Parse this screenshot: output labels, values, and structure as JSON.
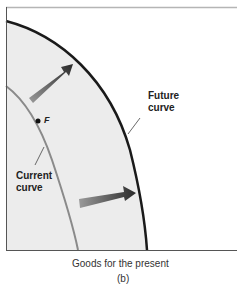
{
  "figure": {
    "panel_label": "(b)",
    "x_axis_label": "Goods for the present",
    "curves": [
      {
        "name": "Future curve",
        "line1": "Future",
        "line2": "curve",
        "color": "#1a1a1a"
      },
      {
        "name": "Current curve",
        "line1": "Current",
        "line2": "curve",
        "color": "#8a8a8a"
      }
    ],
    "point": {
      "label": "F"
    },
    "arrows": [
      "outward shift arrow (upper)",
      "outward shift arrow (lower)"
    ],
    "colors": {
      "fill": "#ececec",
      "top_rule": "#b5b5b5",
      "axis": "#555555"
    }
  }
}
